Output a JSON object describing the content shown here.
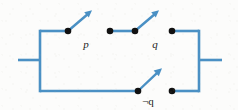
{
  "figure": {
    "kind": "switching-circuit-diagram",
    "width": 238,
    "height": 110,
    "background_color": "#fcfcfb",
    "wire_color": "#4a90c4",
    "node_color": "#111111",
    "label_color": "#1c1c1c",
    "wire_width": 2.6,
    "lever_width": 2.4,
    "node_radius": 3.2
  },
  "frame": {
    "left_rail": {
      "x": 40,
      "y_top": 31,
      "y_bottom": 91
    },
    "right_rail": {
      "x": 199,
      "y_top": 31,
      "y_bottom": 91
    },
    "top_rail_y": 31,
    "bottom_rail_y": 91,
    "left_terminal": {
      "x_start": 18,
      "x_end": 40,
      "y": 60
    },
    "right_terminal": {
      "x_start": 199,
      "x_end": 222,
      "y": 60
    }
  },
  "branches": [
    {
      "id": "branch-top",
      "path_y": 31,
      "switches": [
        {
          "id": "switch-p",
          "label": "p",
          "label_x": 86,
          "label_y": 45,
          "state": "open",
          "pivot": {
            "x": 68,
            "y": 31
          },
          "contact": {
            "x": 110,
            "y": 31
          },
          "lever_tip": {
            "x": 91,
            "y": 11
          }
        },
        {
          "id": "switch-q",
          "label": "q",
          "label_x": 155,
          "label_y": 45,
          "state": "open",
          "pivot": {
            "x": 135,
            "y": 31
          },
          "contact": {
            "x": 172,
            "y": 31
          },
          "lever_tip": {
            "x": 158,
            "y": 11
          }
        }
      ],
      "segments": [
        {
          "x1": 40,
          "y1": 31,
          "x2": 68,
          "y2": 31
        },
        {
          "x1": 110,
          "y1": 31,
          "x2": 135,
          "y2": 31
        },
        {
          "x1": 172,
          "y1": 31,
          "x2": 199,
          "y2": 31
        }
      ]
    },
    {
      "id": "branch-bottom",
      "path_y": 91,
      "switches": [
        {
          "id": "switch-not-q",
          "label": "¬q",
          "label_x": 146,
          "label_y": 103,
          "state": "open",
          "pivot": {
            "x": 138,
            "y": 91
          },
          "contact": {
            "x": 172,
            "y": 91
          },
          "lever_tip": {
            "x": 161,
            "y": 69
          }
        }
      ],
      "segments": [
        {
          "x1": 40,
          "y1": 91,
          "x2": 138,
          "y2": 91
        },
        {
          "x1": 172,
          "y1": 91,
          "x2": 199,
          "y2": 91
        }
      ]
    }
  ],
  "labels": {
    "p": "p",
    "q": "q",
    "not_q": "¬q"
  }
}
